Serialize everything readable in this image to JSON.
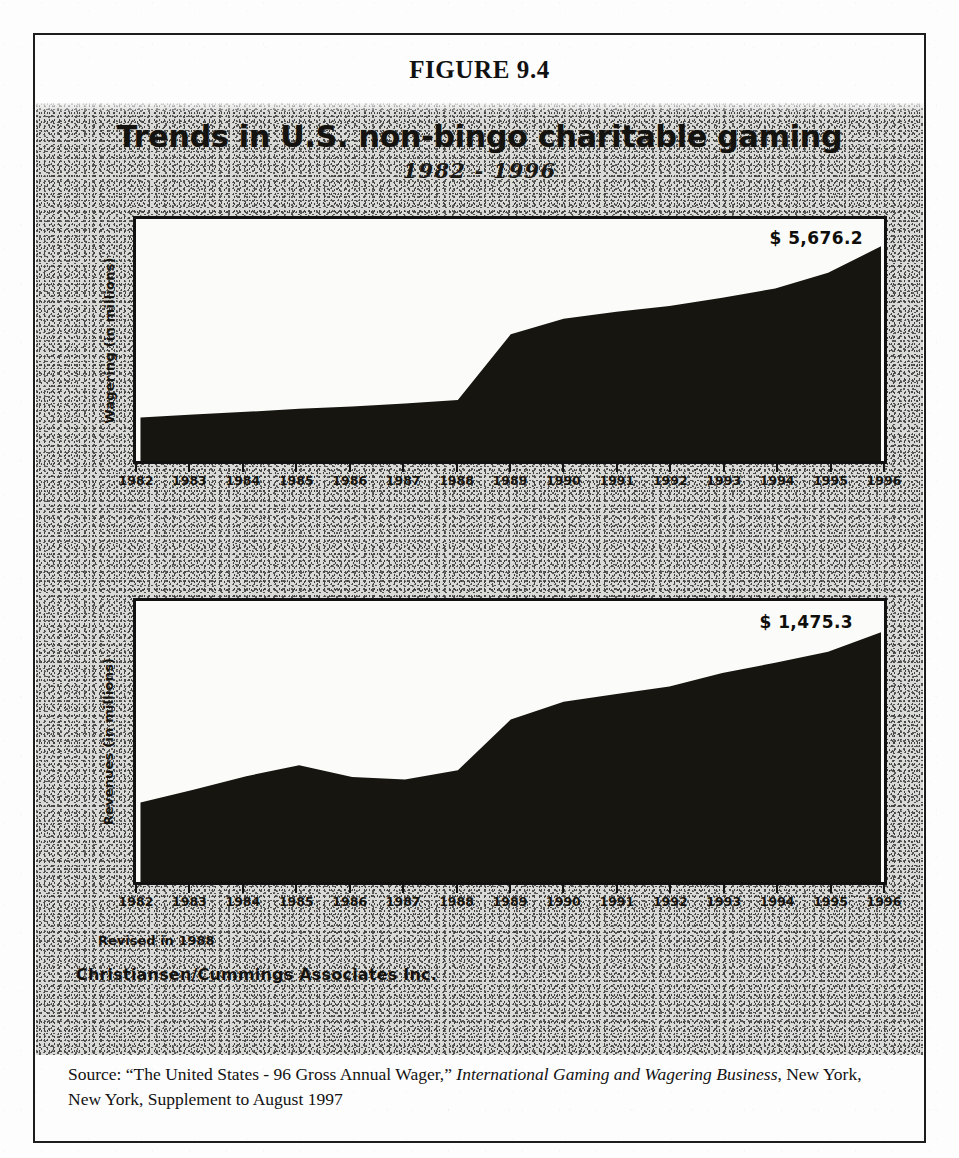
{
  "figure": {
    "caption": "FIGURE 9.4",
    "title": "Trends in U.S. non-bingo charitable gaming",
    "subtitle": "1982 - 1996"
  },
  "notes": {
    "revised": "Revised in 1988",
    "attribution": "Christiansen/Cummings Associates Inc."
  },
  "source": {
    "prefix": "Source: “The United States - 96 Gross Annual Wager,” ",
    "publication": "International Gaming and Wagering Business",
    "suffix": ", New York, New York, Supplement to August 1997"
  },
  "colors": {
    "area": "#17150f",
    "frame": "#111111",
    "panel_background": "#d9d9d6",
    "plot_background": "#fbfbfa",
    "text": "#15130f"
  },
  "chart_data": [
    {
      "id": "wagering",
      "type": "area",
      "title": "Trends in U.S. non-bingo charitable gaming",
      "subtitle": "1982 - 1996",
      "xlabel": "",
      "ylabel": "Wagering (in millions)",
      "categories": [
        1982,
        1983,
        1984,
        1985,
        1986,
        1987,
        1988,
        1989,
        1990,
        1991,
        1992,
        1993,
        1994,
        1995,
        1996
      ],
      "tick_labels": [
        "1982",
        "1983",
        "1984",
        "1985",
        "1986",
        "1987",
        "1988",
        "1989",
        "1990",
        "1991",
        "1992",
        "1993",
        "1994",
        "1995",
        "1996"
      ],
      "values": [
        1150,
        1230,
        1300,
        1380,
        1440,
        1520,
        1610,
        3350,
        3760,
        3950,
        4100,
        4320,
        4560,
        4980,
        5676.2
      ],
      "ylim": [
        0,
        6400
      ],
      "grid": false,
      "end_label": "$ 5,676.2",
      "end_value": 5676.2,
      "legend": null
    },
    {
      "id": "revenues",
      "type": "area",
      "title": "Trends in U.S. non-bingo charitable gaming",
      "subtitle": "1982 - 1996",
      "xlabel": "",
      "ylabel": "Revenues (in millions)",
      "categories": [
        1982,
        1983,
        1984,
        1985,
        1986,
        1987,
        1988,
        1989,
        1990,
        1991,
        1992,
        1993,
        1994,
        1995,
        1996
      ],
      "tick_labels": [
        "1982",
        "1983",
        "1984",
        "1985",
        "1986",
        "1987",
        "1988",
        "1989",
        "1990",
        "1991",
        "1992",
        "1993",
        "1994",
        "1995",
        "1996"
      ],
      "values": [
        470,
        545,
        625,
        690,
        620,
        605,
        660,
        960,
        1065,
        1110,
        1155,
        1235,
        1295,
        1360,
        1475.3
      ],
      "ylim": [
        0,
        1660
      ],
      "grid": false,
      "end_label": "$ 1,475.3",
      "end_value": 1475.3,
      "legend": null
    }
  ]
}
